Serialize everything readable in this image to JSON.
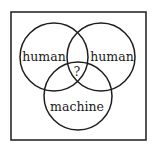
{
  "diagram": {
    "type": "venn",
    "sets": [
      {
        "id": "left",
        "label": "human"
      },
      {
        "id": "right",
        "label": "human"
      },
      {
        "id": "bottom",
        "label": "machine"
      }
    ],
    "intersection_label": "?"
  }
}
